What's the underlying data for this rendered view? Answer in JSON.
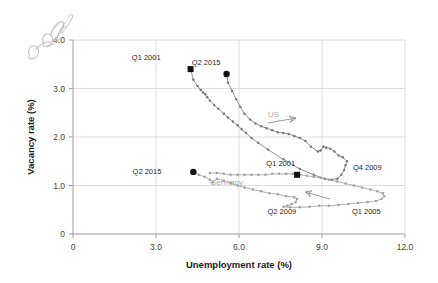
{
  "chart_data": {
    "type": "scatter",
    "title": "",
    "xlabel": "Unemployment rate (%)",
    "ylabel": "Vacancy rate (%)",
    "xlim": [
      0,
      12.0
    ],
    "ylim": [
      0,
      4.0
    ],
    "xticks": [
      "0",
      "3.0",
      "6.0",
      "9.0",
      "12.0"
    ],
    "xtick_values": [
      0,
      3.0,
      6.0,
      9.0,
      12.0
    ],
    "yticks": [
      "0",
      "1.0",
      "2.0",
      "3.0",
      "4.0"
    ],
    "ytick_values": [
      0,
      1.0,
      2.0,
      3.0,
      4.0
    ],
    "grid": true,
    "legend_position": "inline-annotation",
    "series": [
      {
        "name": "US",
        "label": "US",
        "color": "#7a7a7a",
        "points": [
          [
            4.25,
            3.4
          ],
          [
            4.35,
            3.18
          ],
          [
            4.5,
            3.05
          ],
          [
            4.62,
            2.97
          ],
          [
            4.7,
            2.92
          ],
          [
            4.78,
            2.88
          ],
          [
            4.85,
            2.82
          ],
          [
            4.95,
            2.75
          ],
          [
            5.1,
            2.66
          ],
          [
            5.25,
            2.58
          ],
          [
            5.45,
            2.48
          ],
          [
            5.6,
            2.4
          ],
          [
            5.78,
            2.32
          ],
          [
            5.95,
            2.24
          ],
          [
            6.1,
            2.16
          ],
          [
            6.25,
            2.08
          ],
          [
            6.45,
            1.98
          ],
          [
            6.7,
            1.88
          ],
          [
            7.05,
            1.74
          ],
          [
            7.6,
            1.54
          ],
          [
            8.2,
            1.34
          ],
          [
            8.7,
            1.22
          ],
          [
            9.1,
            1.14
          ],
          [
            9.35,
            1.12
          ],
          [
            9.55,
            1.14
          ],
          [
            9.7,
            1.22
          ],
          [
            9.8,
            1.32
          ],
          [
            9.85,
            1.42
          ],
          [
            9.9,
            1.5
          ],
          [
            9.75,
            1.58
          ],
          [
            9.6,
            1.62
          ],
          [
            9.45,
            1.7
          ],
          [
            9.3,
            1.76
          ],
          [
            9.15,
            1.78
          ],
          [
            9.05,
            1.8
          ],
          [
            8.95,
            1.72
          ],
          [
            8.85,
            1.7
          ],
          [
            8.6,
            1.8
          ],
          [
            8.4,
            1.92
          ],
          [
            8.2,
            1.98
          ],
          [
            8.0,
            2.02
          ],
          [
            7.8,
            2.06
          ],
          [
            7.6,
            2.08
          ],
          [
            7.4,
            2.1
          ],
          [
            7.2,
            2.14
          ],
          [
            7.0,
            2.18
          ],
          [
            6.8,
            2.22
          ],
          [
            6.6,
            2.28
          ],
          [
            6.4,
            2.36
          ],
          [
            6.2,
            2.48
          ],
          [
            6.05,
            2.62
          ],
          [
            5.9,
            2.78
          ],
          [
            5.75,
            2.95
          ],
          [
            5.6,
            3.12
          ],
          [
            5.55,
            3.3
          ]
        ]
      },
      {
        "name": "Germany",
        "label": "Germany",
        "color": "#a0a0a0",
        "points": [
          [
            4.35,
            1.28
          ],
          [
            4.55,
            1.22
          ],
          [
            4.75,
            1.18
          ],
          [
            4.95,
            1.12
          ],
          [
            5.05,
            1.06
          ],
          [
            5.2,
            1.14
          ],
          [
            5.45,
            1.1
          ],
          [
            5.7,
            1.05
          ],
          [
            5.95,
            1.0
          ],
          [
            6.2,
            0.96
          ],
          [
            6.5,
            0.92
          ],
          [
            6.8,
            0.88
          ],
          [
            7.1,
            0.84
          ],
          [
            7.4,
            0.82
          ],
          [
            7.7,
            0.78
          ],
          [
            8.0,
            0.76
          ],
          [
            8.1,
            0.72
          ],
          [
            8.05,
            0.66
          ],
          [
            7.9,
            0.62
          ],
          [
            7.75,
            0.58
          ],
          [
            7.6,
            0.56
          ],
          [
            7.85,
            0.55
          ],
          [
            8.2,
            0.55
          ],
          [
            8.55,
            0.56
          ],
          [
            8.9,
            0.58
          ],
          [
            9.25,
            0.58
          ],
          [
            9.6,
            0.6
          ],
          [
            9.95,
            0.62
          ],
          [
            10.3,
            0.64
          ],
          [
            10.65,
            0.66
          ],
          [
            10.95,
            0.68
          ],
          [
            11.15,
            0.72
          ],
          [
            11.25,
            0.78
          ],
          [
            11.2,
            0.84
          ],
          [
            11.0,
            0.88
          ],
          [
            10.75,
            0.92
          ],
          [
            10.45,
            0.96
          ],
          [
            10.15,
            1.0
          ],
          [
            9.85,
            1.04
          ],
          [
            9.55,
            1.08
          ],
          [
            9.25,
            1.12
          ],
          [
            8.95,
            1.16
          ],
          [
            8.7,
            1.18
          ],
          [
            8.45,
            1.2
          ],
          [
            8.2,
            1.22
          ],
          [
            7.95,
            1.24
          ],
          [
            7.7,
            1.24
          ],
          [
            7.45,
            1.24
          ],
          [
            7.2,
            1.24
          ],
          [
            6.95,
            1.22
          ],
          [
            6.7,
            1.22
          ],
          [
            6.45,
            1.22
          ],
          [
            6.2,
            1.22
          ],
          [
            5.95,
            1.22
          ],
          [
            5.7,
            1.22
          ],
          [
            5.45,
            1.24
          ],
          [
            5.2,
            1.26
          ],
          [
            4.95,
            1.26
          ]
        ]
      }
    ],
    "annotations": [
      {
        "id": "us-q1-2001",
        "text": "Q1 2001",
        "marker": "square",
        "x": 4.25,
        "y": 3.4,
        "label_dx": -30,
        "label_dy": -9
      },
      {
        "id": "us-q2-2015",
        "text": "Q2 2015",
        "marker": "circle",
        "x": 5.55,
        "y": 3.3,
        "label_dx": -6,
        "label_dy": -9
      },
      {
        "id": "us-q4-2009",
        "text": "Q4 2009",
        "marker": "none",
        "x": 9.9,
        "y": 1.5,
        "label_dx": 6,
        "label_dy": 9
      },
      {
        "id": "us-series-label",
        "text": "US",
        "marker": "none",
        "x": 7.25,
        "y": 2.42,
        "label_dx": 0,
        "label_dy": 0
      },
      {
        "id": "de-q2-2015",
        "text": "Q2 2015",
        "marker": "circle",
        "x": 4.35,
        "y": 1.28,
        "label_dx": -32,
        "label_dy": 2
      },
      {
        "id": "de-q1-2001",
        "text": "Q1 2001",
        "marker": "square",
        "x": 8.1,
        "y": 1.22,
        "label_dx": -2,
        "label_dy": -9
      },
      {
        "id": "de-q2-2009",
        "text": "Q2 2009",
        "marker": "none",
        "x": 7.55,
        "y": 0.42,
        "label_dx": 0,
        "label_dy": 0
      },
      {
        "id": "de-q1-2005",
        "text": "Q1 2005",
        "marker": "none",
        "x": 10.6,
        "y": 0.42,
        "label_dx": 0,
        "label_dy": 0
      },
      {
        "id": "de-series-label",
        "text": "Germany",
        "marker": "none",
        "x": 5.55,
        "y": 1.02,
        "label_dx": 0,
        "label_dy": 0
      }
    ]
  },
  "handwriting": {
    "line1": "flo",
    "line2": "ofroifo~l"
  },
  "colors": {
    "us_series": "#7a7a7a",
    "germany_series": "#a0a0a0",
    "marker_black": "#111111",
    "grid": "#d6d6d6",
    "axis": "#9a9a9a",
    "text": "#1a1a1a",
    "series_label": "#a8a8a8",
    "handwriting": "#b9b9b9"
  }
}
